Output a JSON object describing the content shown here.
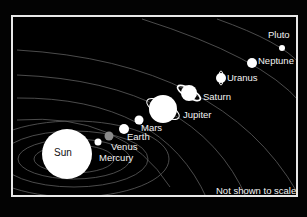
{
  "note": "Not shown to scale",
  "bodies": [
    {
      "name": "Sun",
      "label": "Sun",
      "color": "#ffffff"
    },
    {
      "name": "Mercury",
      "label": "Mercury",
      "color": "#ffffff"
    },
    {
      "name": "Venus",
      "label": "Venus",
      "color": "#8a8a8a"
    },
    {
      "name": "Earth",
      "label": "Earth",
      "color": "#ffffff"
    },
    {
      "name": "Mars",
      "label": "Mars",
      "color": "#ffffff"
    },
    {
      "name": "Jupiter",
      "label": "Jupiter",
      "color": "#ffffff"
    },
    {
      "name": "Saturn",
      "label": "Saturn",
      "color": "#ffffff"
    },
    {
      "name": "Uranus",
      "label": "Uranus",
      "color": "#ffffff"
    },
    {
      "name": "Neptune",
      "label": "Neptune",
      "color": "#ffffff"
    },
    {
      "name": "Pluto",
      "label": "Pluto",
      "color": "#ffffff"
    }
  ],
  "colors": {
    "background": "#000000",
    "frame": "#e8e8e8",
    "orbit": "#6a6a6a",
    "text": "#f2f2f2"
  }
}
